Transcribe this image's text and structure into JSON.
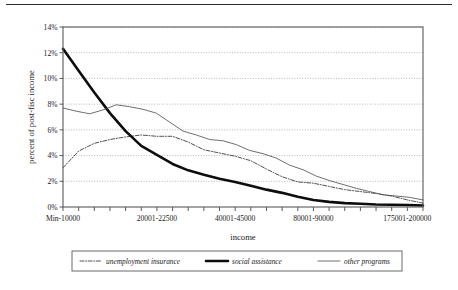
{
  "chart_data": {
    "type": "line",
    "title": "",
    "xlabel": "income",
    "ylabel": "percent of post-fisc income",
    "ylim": [
      0,
      14
    ],
    "ytick_labels": [
      "0%",
      "2%",
      "4%",
      "6%",
      "8%",
      "10%",
      "12%",
      "14%"
    ],
    "ytick_values": [
      0,
      2,
      4,
      6,
      8,
      10,
      12,
      14
    ],
    "grid": "horizontal-dotted",
    "legend_position": "below-plot",
    "x_count": 24,
    "xtick_labels": [
      "Min-10000",
      "20001-22500",
      "40001-45000",
      "80001-90000",
      "175001-200000"
    ],
    "xtick_indices": [
      0,
      6,
      11,
      16,
      22
    ],
    "series": [
      {
        "name": "unemployment insurance",
        "style": "dash-dot",
        "color": "#3d3d3d",
        "width": 0.9,
        "values": [
          3.05,
          4.35,
          4.95,
          5.25,
          5.45,
          5.6,
          5.5,
          5.5,
          5.05,
          4.45,
          4.2,
          3.95,
          3.6,
          2.95,
          2.35,
          1.95,
          1.85,
          1.6,
          1.35,
          1.2,
          1.05,
          0.85,
          0.55,
          0.3
        ]
      },
      {
        "name": "social assistance",
        "style": "solid-thick",
        "color": "#0d0d0d",
        "width": 2.6,
        "values": [
          12.3,
          10.6,
          8.9,
          7.3,
          5.9,
          4.75,
          4.05,
          3.35,
          2.85,
          2.5,
          2.2,
          1.95,
          1.65,
          1.35,
          1.1,
          0.8,
          0.55,
          0.4,
          0.3,
          0.25,
          0.2,
          0.18,
          0.15,
          0.12
        ]
      },
      {
        "name": "other programs",
        "style": "solid-thin",
        "color": "#4a4a4a",
        "width": 0.8,
        "values": [
          7.7,
          7.45,
          7.25,
          7.55,
          7.95,
          7.8,
          7.6,
          7.3,
          6.6,
          5.9,
          5.6,
          5.25,
          5.15,
          4.85,
          4.4,
          4.15,
          3.8,
          3.25,
          2.9,
          2.4,
          2.05,
          1.75,
          1.45,
          1.2,
          0.95,
          0.85,
          0.75,
          0.55
        ]
      }
    ]
  },
  "legend": {
    "items": [
      {
        "label": "unemployment insurance",
        "swatch": "dash-dot-swatch"
      },
      {
        "label": "social assistance",
        "swatch": "thick-line-swatch"
      },
      {
        "label": "other programs",
        "swatch": "thin-line-swatch"
      }
    ]
  }
}
